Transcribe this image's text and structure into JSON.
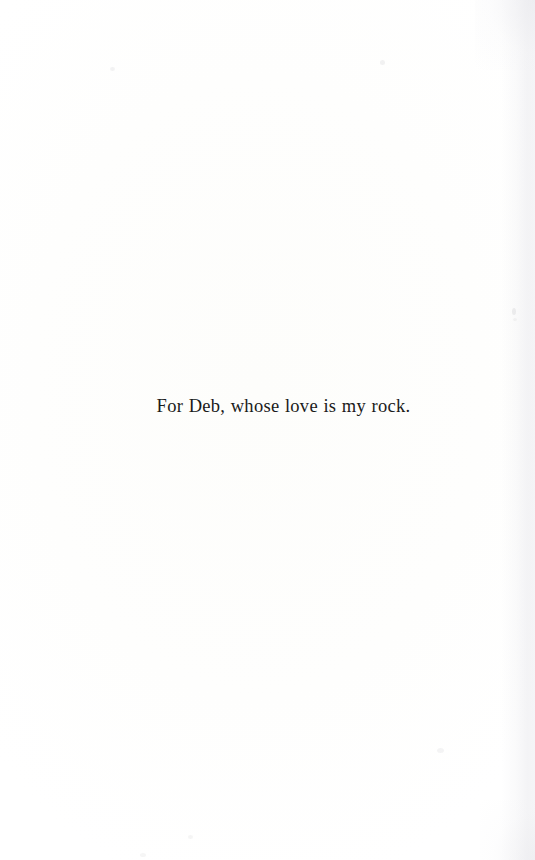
{
  "document": {
    "type": "book-dedication-page",
    "page_background_color": "#fefefe",
    "text_color": "#1a1a1a"
  },
  "dedication": {
    "text": "For Deb, whose love is my rock."
  },
  "scan_artifacts": {
    "specks": [
      {
        "name": "speck-upper-left",
        "x": 110,
        "y": 67,
        "w": 5,
        "h": 4,
        "opacity": 0.055
      },
      {
        "name": "speck-upper-right",
        "x": 380,
        "y": 60,
        "w": 5,
        "h": 5,
        "opacity": 0.06
      },
      {
        "name": "speck-right-margin",
        "x": 512,
        "y": 308,
        "w": 4,
        "h": 7,
        "opacity": 0.07
      },
      {
        "name": "speck-right-margin-low",
        "x": 513,
        "y": 318,
        "w": 4,
        "h": 3,
        "opacity": 0.045
      },
      {
        "name": "speck-lower-right",
        "x": 437,
        "y": 748,
        "w": 7,
        "h": 5,
        "opacity": 0.05
      },
      {
        "name": "speck-lower-left",
        "x": 188,
        "y": 835,
        "w": 5,
        "h": 4,
        "opacity": 0.048
      },
      {
        "name": "speck-bottom-edge",
        "x": 140,
        "y": 853,
        "w": 6,
        "h": 4,
        "opacity": 0.042
      }
    ]
  }
}
